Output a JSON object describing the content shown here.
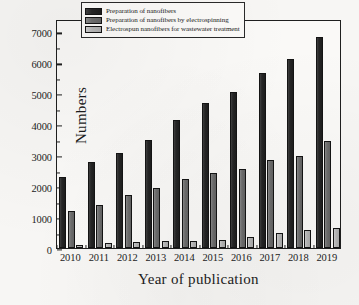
{
  "chart_data": {
    "type": "bar",
    "title": "",
    "xlabel": "Year of publication",
    "ylabel": "Numbers",
    "categories": [
      "2010",
      "2011",
      "2012",
      "2013",
      "2014",
      "2015",
      "2016",
      "2017",
      "2018",
      "2019"
    ],
    "series": [
      {
        "name": "Preparation of nanofibers",
        "color": "#262626",
        "values": [
          2300,
          2780,
          3080,
          3500,
          4140,
          4700,
          5040,
          5670,
          6100,
          6820
        ]
      },
      {
        "name": "Preparation of nanofibers by electrospinning",
        "color": "#6e6e6e",
        "values": [
          1200,
          1390,
          1710,
          1930,
          2230,
          2410,
          2560,
          2860,
          2960,
          3460
        ]
      },
      {
        "name": "Electrospun nanofibers for wastewater treatment",
        "color": "#b6b6b6",
        "values": [
          100,
          155,
          190,
          215,
          225,
          270,
          360,
          480,
          570,
          650
        ]
      }
    ],
    "ylim": [
      0,
      7400
    ],
    "y_ticks": [
      0,
      1000,
      2000,
      3000,
      4000,
      5000,
      6000,
      7000
    ],
    "y_tick_labels": [
      "0",
      "1000",
      "2000",
      "3000",
      "4000",
      "5000",
      "6000",
      "7000"
    ],
    "y_minor_ticks": [
      500,
      1500,
      2500,
      3500,
      4500,
      5500,
      6500
    ],
    "grid": false,
    "legend_position": "top-center"
  }
}
